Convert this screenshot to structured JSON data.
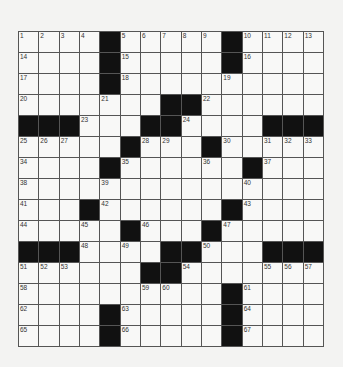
{
  "puzzle": {
    "rows": 15,
    "cols": 15,
    "colors": {
      "block": "#111111",
      "cell": "#f8f8f7",
      "line": "#555555",
      "background": "#f3f3f2"
    },
    "grid": [
      [
        "1",
        "2",
        "3",
        "4",
        "#",
        "5",
        "6",
        "7",
        "8",
        "9",
        "#",
        "10",
        "11",
        "12",
        "13"
      ],
      [
        "14",
        "",
        "",
        "",
        "#",
        "15",
        "",
        "",
        "",
        "",
        "#",
        "16",
        "",
        "",
        ""
      ],
      [
        "17",
        "",
        "",
        "",
        "#",
        "18",
        "",
        "",
        "",
        "",
        "19",
        "",
        "",
        "",
        ""
      ],
      [
        "20",
        "",
        "",
        "",
        "21",
        "",
        "",
        "#",
        "#",
        "22",
        "",
        "",
        "",
        "",
        ""
      ],
      [
        "#",
        "#",
        "#",
        "23",
        "",
        "",
        "#",
        "#",
        "24",
        "",
        "",
        "",
        "#",
        "#",
        "#"
      ],
      [
        "25",
        "26",
        "27",
        "",
        "",
        "#",
        "28",
        "29",
        "",
        "#",
        "30",
        "",
        "31",
        "32",
        "33"
      ],
      [
        "34",
        "",
        "",
        "",
        "#",
        "35",
        "",
        "",
        "",
        "36",
        "",
        "#",
        "37",
        "",
        ""
      ],
      [
        "38",
        "",
        "",
        "",
        "39",
        "",
        "",
        "",
        "",
        "",
        "",
        "40",
        "",
        "",
        ""
      ],
      [
        "41",
        "",
        "",
        "#",
        "42",
        "",
        "",
        "",
        "",
        "",
        "#",
        "43",
        "",
        "",
        ""
      ],
      [
        "44",
        "",
        "",
        "45",
        "",
        "#",
        "46",
        "",
        "",
        "#",
        "47",
        "",
        "",
        "",
        ""
      ],
      [
        "#",
        "#",
        "#",
        "48",
        "",
        "49",
        "",
        "#",
        "#",
        "50",
        "",
        "",
        "#",
        "#",
        "#"
      ],
      [
        "51",
        "52",
        "53",
        "",
        "",
        "",
        "#",
        "#",
        "54",
        "",
        "",
        "",
        "55",
        "56",
        "57"
      ],
      [
        "58",
        "",
        "",
        "",
        "",
        "",
        "59",
        "60",
        "",
        "",
        "#",
        "61",
        "",
        "",
        ""
      ],
      [
        "62",
        "",
        "",
        "",
        "#",
        "63",
        "",
        "",
        "",
        "",
        "#",
        "64",
        "",
        "",
        ""
      ],
      [
        "65",
        "",
        "",
        "",
        "#",
        "66",
        "",
        "",
        "",
        "",
        "#",
        "67",
        "",
        "",
        ""
      ]
    ]
  }
}
